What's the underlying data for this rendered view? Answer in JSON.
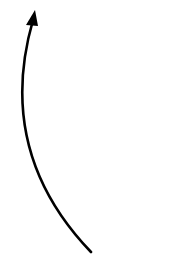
{
  "diagram": {
    "background": "#ffffff",
    "arrow": {
      "label": "",
      "stroke_color": "#000000",
      "stroke_width": 2.6,
      "direction": "up",
      "start": [
        91,
        252
      ],
      "control_points": [
        [
          22,
          180
        ],
        [
          10,
          100
        ]
      ],
      "end": [
        33,
        20
      ],
      "head": {
        "tip": [
          35,
          10
        ],
        "left": [
          26,
          25
        ],
        "right": [
          38,
          26
        ]
      }
    }
  }
}
